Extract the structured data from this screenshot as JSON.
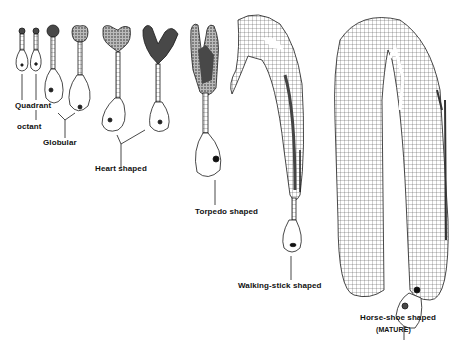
{
  "diagram": {
    "type": "biology-illustration",
    "labels": {
      "quadrant": "Quadrant",
      "octant": "octant",
      "globular": "Globular",
      "heart": "Heart shaped",
      "torpedo": "Torpedo shaped",
      "walking_stick": "Walking-stick shaped",
      "horse_shoe": "Horse-shoe shaped",
      "mature": "(MATURE)"
    },
    "colors": {
      "ink": "#1a1a1a",
      "background": "#ffffff",
      "stipple": "#555555"
    }
  }
}
